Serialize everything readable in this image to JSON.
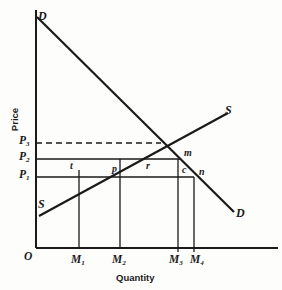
{
  "figure": {
    "kind": "supply-demand-diagram",
    "background_color": "#fdfdfc",
    "line_color": "#1a1a1a"
  },
  "axes": {
    "y_title": "Price",
    "x_title": "Quantity",
    "origin_label": "O",
    "x_range_px": [
      36,
      278
    ],
    "y_range_px": [
      10,
      248
    ]
  },
  "price_levels": [
    {
      "key": "P3",
      "label": "P",
      "sub": "3",
      "y_px": 143,
      "style": "dashed",
      "x_end_px": 161
    },
    {
      "key": "P2",
      "label": "P",
      "sub": "2",
      "y_px": 159,
      "style": "solid",
      "x_end_px": 181
    },
    {
      "key": "P1",
      "label": "P",
      "sub": "1",
      "y_px": 177,
      "style": "solid",
      "x_end_px": 194
    }
  ],
  "quantities": [
    {
      "key": "M1",
      "label": "M",
      "sub": "1",
      "x_px": 79
    },
    {
      "key": "M2",
      "label": "M",
      "sub": "2",
      "x_px": 120
    },
    {
      "key": "M3",
      "label": "M",
      "sub": "3",
      "x_px": 178
    },
    {
      "key": "M4",
      "label": "M",
      "sub": "4",
      "x_px": 194
    }
  ],
  "curves": {
    "demand": {
      "label": "D",
      "top_label": "D",
      "end_label": "D",
      "from_px": [
        37,
        17
      ],
      "to_px": [
        234,
        212
      ]
    },
    "supply": {
      "label": "S",
      "bottom_label": "S",
      "end_label": "S",
      "from_px": [
        39,
        216
      ],
      "to_px": [
        228,
        113
      ]
    }
  },
  "region_labels": [
    {
      "text": "t",
      "x_px": 70,
      "y_px": 166
    },
    {
      "text": "p",
      "x_px": 112,
      "y_px": 169
    },
    {
      "text": "r",
      "x_px": 146,
      "y_px": 166
    },
    {
      "text": "c",
      "x_px": 184,
      "y_px": 171
    }
  ],
  "point_labels": [
    {
      "text": "m",
      "x_px": 186,
      "y_px": 153
    },
    {
      "text": "n",
      "x_px": 200,
      "y_px": 172
    }
  ]
}
